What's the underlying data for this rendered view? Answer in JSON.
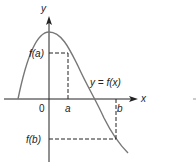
{
  "diagram": {
    "axes": {
      "x_label": "x",
      "y_label": "y",
      "origin_label": "0"
    },
    "curve_label": "y = f(x)",
    "points": {
      "a_label": "a",
      "b_label": "b",
      "fa_label": "f(a)",
      "fb_label": "f(b)"
    },
    "colors": {
      "curve": "#777777",
      "axis": "#222222",
      "dash": "#222222"
    }
  }
}
